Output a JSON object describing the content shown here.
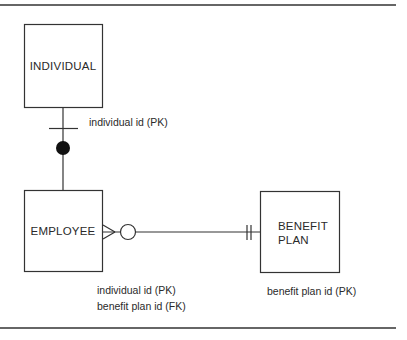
{
  "diagram": {
    "type": "entity-relationship",
    "entities": [
      {
        "id": "individual",
        "label_lines": [
          "INDIVIDUAL"
        ],
        "attributes": [
          "individual id (PK)"
        ]
      },
      {
        "id": "employee",
        "label_lines": [
          "EMPLOYEE"
        ],
        "attributes": [
          "individual id (PK)",
          "benefit plan id (FK)"
        ]
      },
      {
        "id": "benefit_plan",
        "label_lines": [
          "BENEFIT",
          "PLAN"
        ],
        "attributes": [
          "benefit plan id (PK)"
        ]
      }
    ],
    "relationships": [
      {
        "from": "individual",
        "to": "employee",
        "from_end": "one (single bar)",
        "to_end": "mandatory/exclusive (filled circle)"
      },
      {
        "from": "employee",
        "to": "benefit_plan",
        "from_end": "zero-or-many (crow's foot + open circle)",
        "to_end": "exactly one (double bar)"
      }
    ],
    "line_color": "#333333",
    "background": "#ffffff"
  }
}
